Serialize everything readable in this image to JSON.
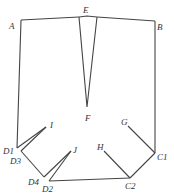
{
  "labels": {
    "A": "A",
    "B": "B",
    "E": "E",
    "F": "F",
    "G": "G",
    "H": "H",
    "I": "I",
    "J": "J",
    "C1": "C1",
    "C2": "C2",
    "D1": "D1",
    "D2": "D2",
    "D3": "D3",
    "D4": "D4"
  }
}
